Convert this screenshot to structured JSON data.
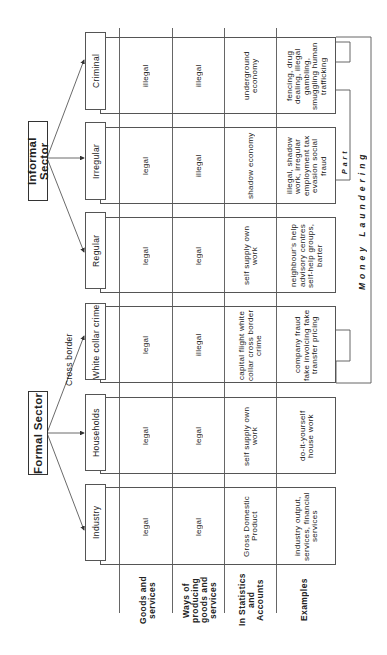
{
  "sectors": {
    "informal": {
      "label": "Informal Sector"
    },
    "formal": {
      "label": "Formal Sector"
    }
  },
  "cross_border_label": "Cross border",
  "row_labels": [
    "Goods and services",
    "Ways of producing goods and services",
    "In Statistics and Accounts",
    "Examples"
  ],
  "columns": [
    {
      "sector": "Informal Sector",
      "header": "Criminal",
      "goods": "illegal",
      "ways": "illegal",
      "statistics": "underground economy",
      "examples": "fencing, drug dealing, illegal gambling, smuggling human trafficking"
    },
    {
      "sector": "Informal Sector",
      "header": "Irregular",
      "goods": "legal",
      "ways": "illegal",
      "statistics": "shadow economy",
      "examples": "illegal, shadow work, irregular employment tax evasion social fraud"
    },
    {
      "sector": "Informal Sector",
      "header": "Regular",
      "goods": "legal",
      "ways": "legal",
      "statistics": "self supply own work",
      "examples": "neighbour's help advisory centres self-help groups, barter"
    },
    {
      "sector": "Formal Sector",
      "header": "White collar crime",
      "goods": "legal",
      "ways": "illegal",
      "statistics": "capital flight white collar cross border crime",
      "examples": "company fraud fake invoicing fake transfer pricing"
    },
    {
      "sector": "Formal Sector",
      "header": "Households",
      "goods": "legal",
      "ways": "legal",
      "statistics": "self supply own work",
      "examples": "do-it-yourself house work"
    },
    {
      "sector": "Formal Sector",
      "header": "Industry",
      "goods": "legal",
      "ways": "legal",
      "statistics": "Gross Domestic Product",
      "examples": "industry output, services, financial services"
    }
  ],
  "bracket": {
    "money_laundering_label": "Money Laundering",
    "part_label": "Part"
  }
}
